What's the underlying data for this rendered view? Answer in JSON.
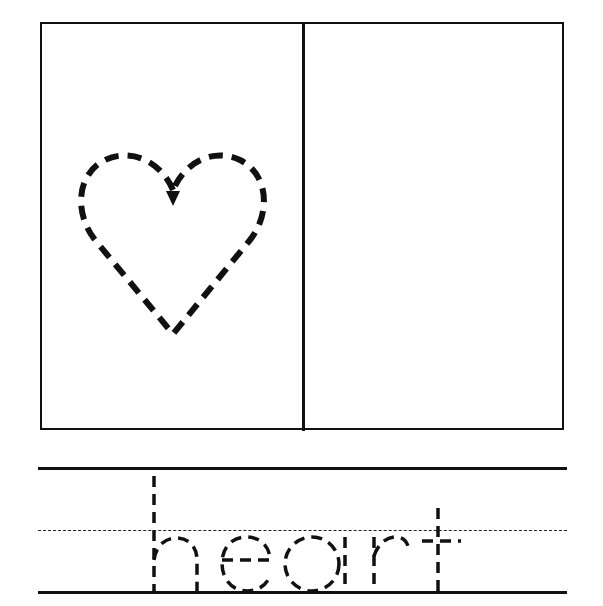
{
  "worksheet": {
    "type": "tracing-worksheet",
    "picture": {
      "shape": "heart",
      "style": "dashed-outline",
      "start_arrow": "arrow-down-icon"
    },
    "drawing_panel": {
      "content": ""
    },
    "word": "heart",
    "letters": [
      "h",
      "e",
      "a",
      "r",
      "t"
    ],
    "writing_lines": {
      "top": "solid",
      "middle": "dashed",
      "bottom": "solid"
    },
    "colors": {
      "ink": "#111111",
      "background": "#ffffff"
    }
  }
}
